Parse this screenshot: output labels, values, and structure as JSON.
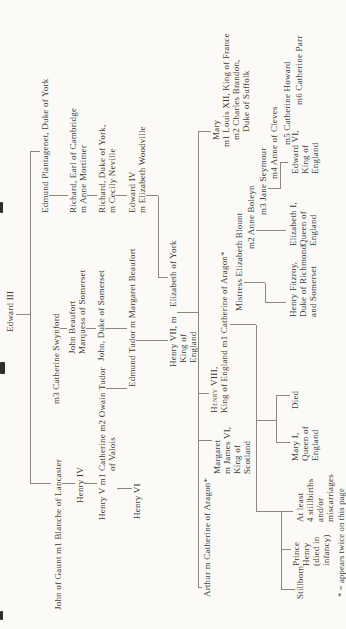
{
  "figure": {
    "type": "family-tree",
    "footnote": "* = appears twice on this page"
  },
  "nodes": {
    "edward_iii": {
      "text": "Edward III"
    },
    "john_of_gaunt": {
      "text": "John of Gaunt m1 Blanche of Lancaster"
    },
    "catherine_swynford": {
      "text": "m3 Catherine Swynford"
    },
    "edmund_plantagenet": {
      "text": "Edmund Plantagenet, Duke of York"
    },
    "henry_iv": {
      "text": "Henry IV"
    },
    "john_beaufort": {
      "lines": [
        "John Beaufort",
        "Marquess of Somerset"
      ]
    },
    "richard_cambridge": {
      "lines": [
        "Richard, Earl of Cambridge",
        "m Anne Mortimer"
      ]
    },
    "henry_v": {
      "lines": [
        "Henry V m1 Catherine m2 Owain Tudor",
        "of Valois"
      ]
    },
    "john_somerset": {
      "text": "John, Duke of Somerset"
    },
    "richard_york": {
      "lines": [
        "Richard, Duke of York,",
        "m Cecily Neville"
      ]
    },
    "henry_vi": {
      "text": "Henry VI"
    },
    "edmund_tudor": {
      "text": "Edmund Tudor m Margaret Beaufort"
    },
    "edward_iv": {
      "lines": [
        "Edward IV",
        "m Elizabeth Woodville"
      ]
    },
    "henry_vii": {
      "name": "Henry VII, m",
      "spouse": "Elizabeth of York",
      "lines": [
        "King of",
        "England"
      ]
    },
    "arthur": {
      "text": "Arthur m Catherine of Aragon*"
    },
    "margaret": {
      "lines": [
        "Margaret",
        "m James VI,",
        "King of",
        "Scotland"
      ]
    },
    "henry_viii": {
      "name": "Henry VIII,",
      "line2": "King of England m1 Catherine of Aragon*"
    },
    "mary_tudor": {
      "lines": [
        "Mary",
        "m1 Louis XII, King of France",
        "m2 Charles Brandon,",
        "Duke of Suffolk"
      ]
    },
    "elizabeth_blount": {
      "text": "Mistress Elizabeth Blount"
    },
    "anne_boleyn": {
      "text": "m2 Anne Boleyn"
    },
    "jane_seymour": {
      "text": "m3 Jane Seymour"
    },
    "anne_cleves": {
      "text": "m4 Anne of Cleves"
    },
    "catherine_howard": {
      "text": "m5 Catherine Howard"
    },
    "catherine_parr": {
      "text": "m6 Catherine Parr"
    },
    "stillborn": {
      "text": "Stillborn"
    },
    "prince_henry": {
      "lines": [
        "Prince",
        "Henry",
        "(died in",
        "infancy)"
      ]
    },
    "stillbirths": {
      "lines": [
        "At least",
        "4 stillbirths",
        "and/or",
        "miscarriages"
      ]
    },
    "mary_i": {
      "lines": [
        "Mary I,",
        "Queen of",
        "England"
      ]
    },
    "died": {
      "text": "Died"
    },
    "henry_fitzroy": {
      "lines": [
        "Henry Fitzroy,",
        "Duke of Richmond",
        "and Somerset"
      ]
    },
    "elizabeth_i": {
      "lines": [
        "Elizabeth I,",
        "Queen of",
        "England"
      ]
    },
    "edward_vi": {
      "lines": [
        "Edward VI,",
        "King of",
        "England"
      ]
    }
  }
}
